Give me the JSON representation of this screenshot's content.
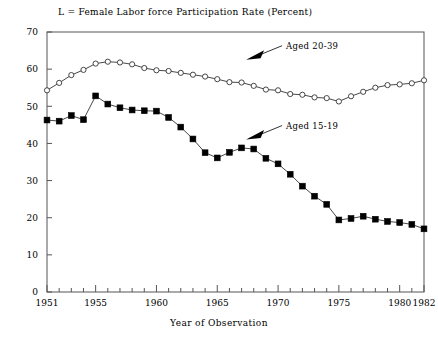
{
  "chart_data": {
    "type": "line",
    "title": "L = Female Labor force Participation Rate (Percent)",
    "xlabel": "Year of Observation",
    "ylabel": "",
    "xlim": [
      1951,
      1982
    ],
    "ylim": [
      0,
      70
    ],
    "grid": false,
    "legend_position": "inline-annotations",
    "x": [
      1951,
      1952,
      1953,
      1954,
      1955,
      1956,
      1957,
      1958,
      1959,
      1960,
      1961,
      1962,
      1963,
      1964,
      1965,
      1966,
      1967,
      1968,
      1969,
      1970,
      1971,
      1972,
      1973,
      1974,
      1975,
      1976,
      1977,
      1978,
      1979,
      1980,
      1981,
      1982
    ],
    "xticks": [
      1951,
      1955,
      1960,
      1965,
      1970,
      1975,
      1980,
      1982
    ],
    "xtick_labels": [
      "1951",
      "1955",
      "1960",
      "1965",
      "1970",
      "1975",
      "1980",
      "1982"
    ],
    "yticks": [
      0,
      10,
      20,
      30,
      40,
      50,
      60,
      70
    ],
    "ytick_labels": [
      "0",
      "10",
      "20",
      "30",
      "40",
      "50",
      "60",
      "70"
    ],
    "series": [
      {
        "name": "Aged 20-39",
        "marker": "open-circle",
        "values": [
          54.3,
          56.3,
          58.4,
          59.8,
          61.5,
          62.0,
          61.8,
          61.3,
          60.3,
          59.7,
          59.5,
          59.0,
          58.5,
          58.0,
          57.3,
          56.5,
          56.4,
          55.5,
          54.5,
          54.3,
          53.3,
          53.1,
          52.4,
          52.2,
          51.3,
          52.7,
          53.9,
          55.0,
          55.7,
          55.9,
          56.2,
          57.0
        ]
      },
      {
        "name": "Aged 15-19",
        "marker": "filled-square",
        "values": [
          46.3,
          46.0,
          47.5,
          46.4,
          52.8,
          50.6,
          49.6,
          49.0,
          48.8,
          48.7,
          47.0,
          44.4,
          41.2,
          37.5,
          36.1,
          37.6,
          38.8,
          38.5,
          36.0,
          34.5,
          31.7,
          28.5,
          25.8,
          23.6,
          19.4,
          19.8,
          20.4,
          19.6,
          19.0,
          18.7,
          18.2,
          17.0
        ]
      }
    ],
    "annotations": [
      {
        "text": "Aged 20-39",
        "x": 1970,
        "y": 62.0,
        "arrow": "down-left"
      },
      {
        "text": "Aged 15-19",
        "x": 1970,
        "y": 40.5,
        "arrow": "down-left"
      }
    ]
  }
}
